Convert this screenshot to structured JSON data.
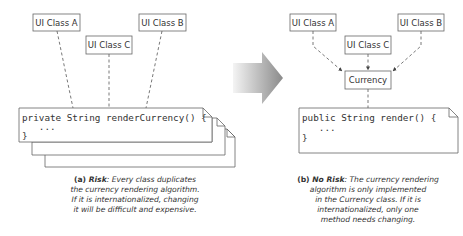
{
  "left_diagram": {
    "classes": [
      {
        "id": "a",
        "label": "UI Class A"
      },
      {
        "id": "c",
        "label": "UI Class C"
      },
      {
        "id": "b",
        "label": "UI Class B"
      }
    ],
    "note": {
      "line1": "private String renderCurrency() {",
      "line2": "   ...",
      "line3": "}"
    },
    "caption": {
      "tag": "(a)",
      "label": "Risk",
      "text_lines": [
        ": Every class duplicates",
        "the currency rendering algorithm.",
        "If it is internationalized, changing",
        "it will be difficult and expensive."
      ]
    }
  },
  "arrow": {
    "direction": "right",
    "color_start": "#f2f2f2",
    "color_end": "#8c8c8c"
  },
  "right_diagram": {
    "classes": [
      {
        "id": "a",
        "label": "UI Class A"
      },
      {
        "id": "c",
        "label": "UI Class C"
      },
      {
        "id": "b",
        "label": "UI Class B"
      }
    ],
    "currency": {
      "label": "Currency"
    },
    "note": {
      "line1": "public String render() {",
      "line2": "   ...",
      "line3": "}"
    },
    "caption": {
      "tag": "(b)",
      "label": "No Risk",
      "text_lines": [
        ": The currency rendering",
        "algorithm is only implemented",
        "in the Currency class. If it is",
        "internationalized, only one",
        "method needs changing."
      ]
    }
  }
}
